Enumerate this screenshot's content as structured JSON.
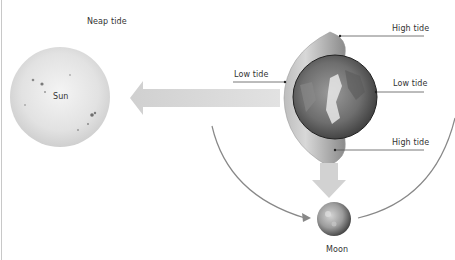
{
  "diagram": {
    "title": "Neap tide",
    "bodies": {
      "sun": {
        "label": "Sun"
      },
      "earth": {
        "label": ""
      },
      "moon": {
        "label": "Moon"
      }
    },
    "labels": {
      "high_tide_top": "High tide",
      "low_tide_right": "Low tide",
      "high_tide_bottom": "High tide",
      "low_tide_left": "Low tide"
    },
    "arrows": [
      {
        "name": "sun-gravity-arrow",
        "direction": "left",
        "from": "earth",
        "to": "sun"
      },
      {
        "name": "moon-gravity-arrow",
        "direction": "down",
        "from": "earth",
        "to": "moon"
      }
    ],
    "orbit_arcs": [
      {
        "name": "orbit-arc-left",
        "arrowhead": true
      },
      {
        "name": "orbit-arc-right",
        "arrowhead": false
      }
    ],
    "colors": {
      "background": "#ffffff",
      "arrow_fill": "#d6d6d6",
      "orbit_line": "#888888",
      "leader_line": "#555555",
      "text": "#333333"
    }
  }
}
